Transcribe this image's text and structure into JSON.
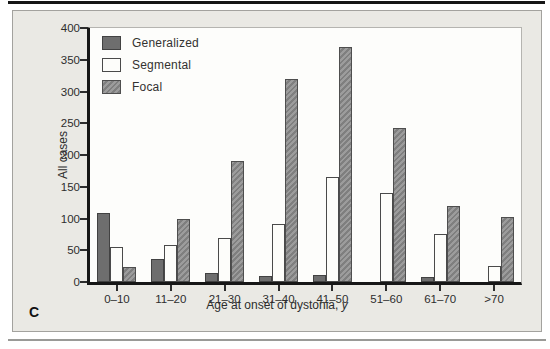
{
  "panel_label": "C",
  "colors": {
    "generalized_fill": "#6e6e6e",
    "segmental_fill": "#fdfdfa",
    "focal_fill": "#8d8d8d",
    "panel_background": "#eae9e4",
    "axis": "#161616"
  },
  "chart_data": {
    "type": "bar",
    "title": "",
    "categories": [
      "0–10",
      "11–20",
      "21–30",
      "31–40",
      "41–50",
      "51–60",
      "61–70",
      ">70"
    ],
    "series": [
      {
        "name": "Generalized",
        "values": [
          108,
          36,
          14,
          10,
          11,
          0,
          8,
          0
        ]
      },
      {
        "name": "Segmental",
        "values": [
          55,
          58,
          70,
          92,
          165,
          140,
          75,
          26
        ]
      },
      {
        "name": "Focal",
        "values": [
          24,
          100,
          190,
          320,
          370,
          242,
          120,
          103
        ]
      }
    ],
    "xlabel": "Age at onset of dystonia, y",
    "xlabel_main": "Age at onset of dystonia, ",
    "xlabel_italic": "y",
    "ylabel": "All cases",
    "ylim": [
      0,
      400
    ],
    "ytick_step": 50,
    "legend_position": "top-left",
    "grid": false
  }
}
